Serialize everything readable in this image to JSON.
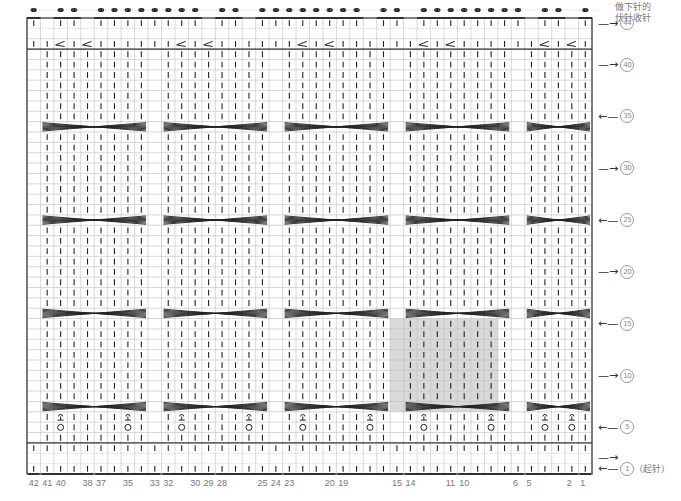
{
  "chart_data": {
    "type": "table",
    "stitches": 42,
    "rows": 44,
    "column_labels": [
      "42",
      "41",
      "40",
      "38",
      "37",
      "35",
      "33",
      "32",
      "30",
      "29",
      "28",
      "25",
      "24",
      "23",
      "20",
      "19",
      "15",
      "14",
      "11",
      "10",
      "6",
      "5",
      "2",
      "1"
    ],
    "row_labels": [
      {
        "row": 44,
        "text": "44",
        "arrow": "right"
      },
      {
        "row": 40,
        "text": "40",
        "arrow": "right"
      },
      {
        "row": 35,
        "text": "35",
        "arrow": "left"
      },
      {
        "row": 30,
        "text": "30",
        "arrow": "right"
      },
      {
        "row": 25,
        "text": "25",
        "arrow": "left"
      },
      {
        "row": 20,
        "text": "20",
        "arrow": "right"
      },
      {
        "row": 15,
        "text": "15",
        "arrow": "left"
      },
      {
        "row": 10,
        "text": "10",
        "arrow": "right"
      },
      {
        "row": 5,
        "text": "5",
        "arrow": "left"
      },
      {
        "row": 2,
        "text": "",
        "arrow": "right"
      },
      {
        "row": 1,
        "text": "1",
        "arrow": "left"
      }
    ],
    "cable_panels": [
      {
        "from_stitch": 41,
        "to_stitch": 34
      },
      {
        "from_stitch": 32,
        "to_stitch": 25
      },
      {
        "from_stitch": 23,
        "to_stitch": 16
      },
      {
        "from_stitch": 14,
        "to_stitch": 7
      },
      {
        "from_stitch": 5,
        "to_stitch": 1
      }
    ],
    "cable_cross_rows": [
      7,
      16,
      25,
      34
    ],
    "yarn_over_row": 5,
    "twisted_stitch_row": 6,
    "decrease_row": 42,
    "bind_off_row": 45,
    "highlight": {
      "from_stitch": 15,
      "to_stitch": 8,
      "from_row": 7,
      "to_row": 15,
      "color": "#d9d9d9"
    }
  },
  "annotations": {
    "top_note_line1": "做下针的",
    "top_note_line2": "伏针收针",
    "cast_on_label": "（起针）"
  },
  "colors": {
    "grid": "#bdbdbd",
    "border": "#333333",
    "symbol": "#222222",
    "highlight": "#d9d9d9",
    "label": "#777777"
  }
}
